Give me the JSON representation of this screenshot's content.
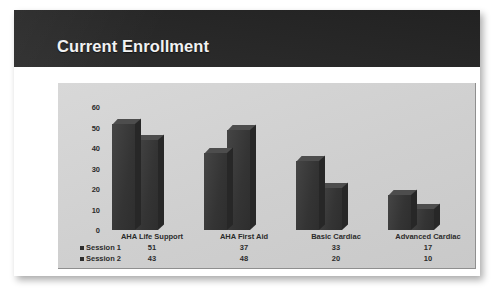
{
  "slide": {
    "title": "Current Enrollment",
    "header_color": "#262626",
    "panel_color": "#d3d3d3",
    "bar_color": "#3b3b3b"
  },
  "chart_data": {
    "type": "bar",
    "title": "Current Enrollment",
    "xlabel": "",
    "ylabel": "",
    "ylim": [
      0,
      60
    ],
    "yticks": [
      "0",
      "10",
      "20",
      "30",
      "40",
      "50",
      "60"
    ],
    "grid": false,
    "legend_position": "bottom-left",
    "three_d": true,
    "categories": [
      "AHA Life Support",
      "AHA First Aid",
      "Basic Cardiac",
      "Advanced Cardiac"
    ],
    "series": [
      {
        "name": "Session 1",
        "values": [
          51,
          37,
          33,
          17
        ]
      },
      {
        "name": "Session 2",
        "values": [
          43,
          48,
          20,
          10
        ]
      }
    ],
    "data_table": {
      "row_headers": [
        "Session 1",
        "Session 2"
      ],
      "column_headers": [
        "AHA Life Support",
        "AHA First Aid",
        "Basic Cardiac",
        "Advanced Cardiac"
      ],
      "rows": [
        [
          "51",
          "37",
          "33",
          "17"
        ],
        [
          "43",
          "48",
          "20",
          "10"
        ]
      ]
    }
  }
}
